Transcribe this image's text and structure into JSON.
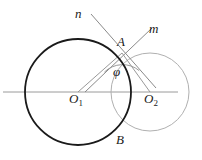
{
  "figure": {
    "canvas": {
      "width": 202,
      "height": 160,
      "background": "#ffffff"
    },
    "colors": {
      "circle_large": "#1a1a1a",
      "circle_small": "#b0b0b0",
      "axis_line": "#9a9a9a",
      "ray_line": "#8a8a8a",
      "segment_line": "#9a9a9a",
      "angle_arc": "#9a9a9a",
      "label_text": "#1a1a1a"
    },
    "labels": {
      "line_n": "n",
      "line_m": "m",
      "point_a": "A",
      "point_b": "B",
      "angle_phi": "φ",
      "center_o1_base": "O",
      "center_o1_sub": "1",
      "center_o2_base": "O",
      "center_o2_sub": "2"
    },
    "geometry": {
      "circle_large": {
        "cx": 78,
        "cy": 92,
        "r": 53,
        "stroke_width": 1.8
      },
      "circle_small": {
        "cx": 150,
        "cy": 92,
        "r": 39,
        "stroke_width": 1.0
      },
      "axis": {
        "x1": 3,
        "y1": 92,
        "x2": 178,
        "y2": 92
      },
      "point_a": {
        "x": 122,
        "y": 53
      },
      "point_b": {
        "x": 118,
        "y": 130
      },
      "ray_n": {
        "x1": 91,
        "y1": 14,
        "x2": 156,
        "y2": 88
      },
      "ray_m": {
        "x1": 152,
        "y1": 28,
        "x2": 85,
        "y2": 92
      },
      "segment_a_o1": {
        "x1": 122,
        "y1": 53,
        "x2": 78,
        "y2": 92
      },
      "segment_a_o2": {
        "x1": 122,
        "y1": 53,
        "x2": 150,
        "y2": 92
      },
      "angle_arc": {
        "cx": 122,
        "cy": 53,
        "r": 26
      }
    }
  }
}
